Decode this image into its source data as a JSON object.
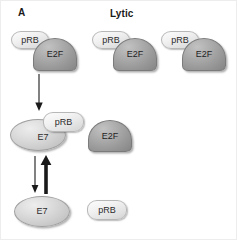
{
  "figure": {
    "panel_label": "A",
    "title": "Lytic",
    "background_color": "#ffffff"
  },
  "palette": {
    "prb_fill": "#eeeeee",
    "prb_stroke": "#b7b7b7",
    "e2f_fill": "#9b9b9b",
    "e2f_stroke": "#7b7b7b",
    "e7_fill": "#d2d2d2",
    "e7_stroke": "#9f9f9f",
    "text_color": "#1a1a1a",
    "arrow_color": "#1a1a1a"
  },
  "labels": {
    "prb": "pRB",
    "e2f": "E2F",
    "e7": "E7"
  },
  "rows": [
    {
      "name": "prb-e2f-complexes-row",
      "complexes": [
        {
          "prb": "pRB",
          "e2f": "E2F"
        },
        {
          "prb": "pRB",
          "e2f": "E2F"
        },
        {
          "prb": "pRB",
          "e2f": "E2F"
        }
      ]
    },
    {
      "name": "e7-prb-complex-row",
      "e7": "E7",
      "prb": "pRB",
      "e2f": "E2F"
    },
    {
      "name": "free-proteins-row",
      "e7": "E7",
      "prb": "pRB"
    }
  ],
  "arrows": [
    {
      "name": "e7-binding-arrow",
      "direction": "down",
      "weight": "thin"
    },
    {
      "name": "dissociation-arrow",
      "direction": "down",
      "weight": "thin"
    },
    {
      "name": "association-arrow",
      "direction": "up",
      "weight": "thick"
    }
  ]
}
